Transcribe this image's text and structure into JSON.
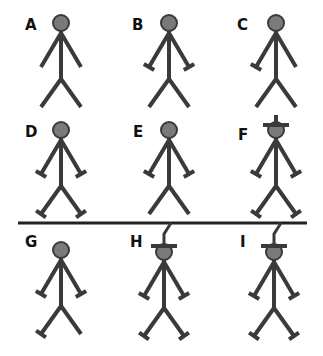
{
  "diagram": {
    "stroke_color": "#3a3a3a",
    "head_color": "#7a7a7a",
    "divider": {
      "x1": 18,
      "x2": 307,
      "y": 223
    },
    "figures": [
      {
        "label": "A",
        "lx": 25,
        "ly": 30,
        "cx": 61,
        "cy": 23,
        "hands": "none",
        "feet": "none",
        "hat": "none"
      },
      {
        "label": "B",
        "lx": 132,
        "ly": 30,
        "cx": 169,
        "cy": 23,
        "hands": "both",
        "feet": "none",
        "hat": "none"
      },
      {
        "label": "C",
        "lx": 237,
        "ly": 30,
        "cx": 276,
        "cy": 23,
        "hands": "left",
        "feet": "none",
        "hat": "none"
      },
      {
        "label": "D",
        "lx": 25,
        "ly": 137,
        "cx": 61,
        "cy": 130,
        "hands": "both",
        "feet": "both",
        "hat": "none"
      },
      {
        "label": "E",
        "lx": 133,
        "ly": 137,
        "cx": 169,
        "cy": 130,
        "hands": "both",
        "feet": "none",
        "hat": "none"
      },
      {
        "label": "F",
        "lx": 238,
        "ly": 140,
        "cx": 276,
        "cy": 130,
        "hands": "both",
        "feet": "both",
        "hat": "cross"
      },
      {
        "label": "G",
        "lx": 25,
        "ly": 247,
        "cx": 61,
        "cy": 250,
        "hands": "both",
        "feet": "left",
        "hat": "none"
      },
      {
        "label": "H",
        "lx": 130,
        "ly": 247,
        "cx": 164,
        "cy": 252,
        "hands": "both",
        "feet": "both",
        "hat": "hook"
      },
      {
        "label": "I",
        "lx": 240,
        "ly": 247,
        "cx": 274,
        "cy": 252,
        "hands": "both",
        "feet": "both",
        "hat": "hook"
      }
    ]
  }
}
